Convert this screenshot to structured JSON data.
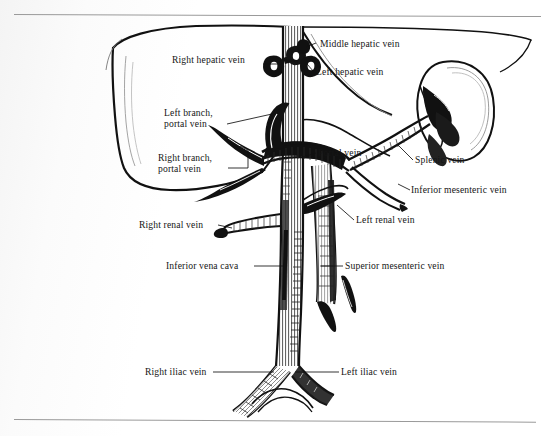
{
  "figure": {
    "title_alt": "Venous anatomy of the liver, portal system and inferior vena cava",
    "background_color": "#ffffff",
    "ink_color": "#111111",
    "rule_color": "#9a9a9a"
  },
  "rules": {
    "top": "horizontal-rule-top",
    "bottom": "horizontal-rule-bottom"
  },
  "labels": [
    {
      "id": "right-hepatic-vein",
      "text": "Right hepatic vein",
      "lines": [
        "Right hepatic vein"
      ],
      "x": 172,
      "y": 60,
      "align": "left"
    },
    {
      "id": "middle-hepatic-vein",
      "text": "Middle hepatic vein",
      "lines": [
        "Middle hepatic vein"
      ],
      "x": 318,
      "y": 38,
      "align": "left"
    },
    {
      "id": "left-hepatic-vein",
      "text": "Left hepatic vein",
      "lines": [
        "Left hepatic vein"
      ],
      "x": 315,
      "y": 67,
      "align": "left"
    },
    {
      "id": "left-branch-portal-vein",
      "text": "Left branch, portal vein",
      "lines": [
        "Left branch,",
        "portal vein"
      ],
      "x": 164,
      "y": 107,
      "align": "left"
    },
    {
      "id": "right-branch-portal-vein",
      "text": "Right branch, portal vein",
      "lines": [
        "Right branch,",
        "portal vein"
      ],
      "x": 158,
      "y": 152,
      "align": "left"
    },
    {
      "id": "portal-vein",
      "text": "Portal vein",
      "lines": [
        "Portal vein"
      ],
      "x": 317,
      "y": 147,
      "align": "left"
    },
    {
      "id": "splenic-vein",
      "text": "Splenic vein",
      "lines": [
        "Splenic vein"
      ],
      "x": 414,
      "y": 155,
      "align": "left"
    },
    {
      "id": "inferior-mesenteric-vein",
      "text": "Inferior mesenteric vein",
      "lines": [
        "Inferior mesenteric vein"
      ],
      "x": 411,
      "y": 185,
      "align": "left"
    },
    {
      "id": "right-renal-vein",
      "text": "Right renal vein",
      "lines": [
        "Right renal vein"
      ],
      "x": 139,
      "y": 220,
      "align": "left"
    },
    {
      "id": "left-renal-vein",
      "text": "Left renal vein",
      "lines": [
        "Left renal vein"
      ],
      "x": 355,
      "y": 215,
      "align": "left"
    },
    {
      "id": "inferior-vena-cava",
      "text": "Inferior vena cava",
      "lines": [
        "Inferior vena cava"
      ],
      "x": 166,
      "y": 261,
      "align": "left"
    },
    {
      "id": "superior-mesenteric-vein",
      "text": "Superior mesenteric vein",
      "lines": [
        "Superior mesenteric vein"
      ],
      "x": 344,
      "y": 261,
      "align": "left"
    },
    {
      "id": "right-iliac-vein",
      "text": "Right iliac vein",
      "lines": [
        "Right iliac vein"
      ],
      "x": 145,
      "y": 367,
      "align": "left"
    },
    {
      "id": "left-iliac-vein",
      "text": "Left iliac vein",
      "lines": [
        "Left iliac vein"
      ],
      "x": 340,
      "y": 367,
      "align": "left"
    }
  ],
  "structures": [
    {
      "id": "liver-outline",
      "name": "liver"
    },
    {
      "id": "spleen-outline",
      "name": "spleen"
    },
    {
      "id": "inferior-vena-cava-trunk",
      "name": "inferior vena cava"
    },
    {
      "id": "portal-vein-trunk",
      "name": "portal vein"
    },
    {
      "id": "splenic-vein-branch",
      "name": "splenic vein"
    },
    {
      "id": "superior-mesenteric-vein-branch",
      "name": "superior mesenteric vein"
    },
    {
      "id": "inferior-mesenteric-vein-branch",
      "name": "inferior mesenteric vein"
    },
    {
      "id": "right-renal-vein-branch",
      "name": "right renal vein"
    },
    {
      "id": "left-renal-vein-branch",
      "name": "left renal vein"
    },
    {
      "id": "right-iliac-vein-branch",
      "name": "right iliac vein"
    },
    {
      "id": "left-iliac-vein-branch",
      "name": "left iliac vein"
    },
    {
      "id": "hepatic-vein-stumps",
      "name": "hepatic vein stumps"
    }
  ]
}
